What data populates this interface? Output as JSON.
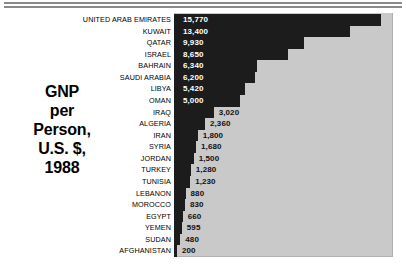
{
  "title": {
    "lines": [
      "GNP",
      "per",
      "Person,",
      "U.S. $,",
      "1988"
    ]
  },
  "colors": {
    "plot_background": "#c9c9c9",
    "bar": "#1c1c1c",
    "label_inside": "#ffffff",
    "label_outside": "#111111",
    "rule": "#8a8a8a"
  },
  "chart_data": {
    "type": "bar",
    "orientation": "horizontal",
    "xlabel": "",
    "ylabel": "",
    "xlim": [
      0,
      20000
    ],
    "grid": false,
    "legend": null,
    "categories": [
      "UNITED ARAB EMIRATES",
      "KUWAIT",
      "QATAR",
      "ISRAEL",
      "BAHRAIN",
      "SAUDI ARABIA",
      "LIBYA",
      "OMAN",
      "IRAQ",
      "ALGERIA",
      "IRAN",
      "SYRIA",
      "JORDAN",
      "TURKEY",
      "TUNISIA",
      "LEBANON",
      "MOROCCO",
      "EGYPT",
      "YEMEN",
      "SUDAN",
      "AFGHANISTAN"
    ],
    "values": [
      15770,
      13400,
      9930,
      8650,
      6340,
      6200,
      5420,
      5000,
      3020,
      2360,
      1800,
      1680,
      1500,
      1280,
      1230,
      880,
      830,
      660,
      595,
      480,
      200
    ],
    "value_labels": [
      "15,770",
      "13,400",
      "9,930",
      "8,650",
      "6,340",
      "6,200",
      "5,420",
      "5,000",
      "3,020",
      "2,360",
      "1,800",
      "1,680",
      "1,500",
      "1,280",
      "1,230",
      "880",
      "830",
      "660",
      "595",
      "480",
      "200"
    ]
  }
}
